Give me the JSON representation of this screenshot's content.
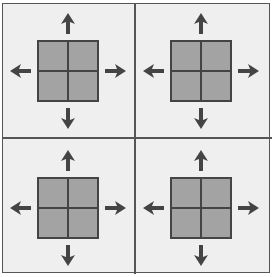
{
  "diagram": {
    "colors": {
      "background": "#efefef",
      "square_fill": "#a3a3a3",
      "lines": "#444444",
      "arrows": "#444444"
    },
    "panels": [
      {
        "id": "top-left",
        "cx": 68,
        "cy": 71,
        "arrows": [
          "up",
          "down",
          "left",
          "right"
        ]
      },
      {
        "id": "top-right",
        "cx": 201,
        "cy": 71,
        "arrows": [
          "up",
          "down",
          "left",
          "right"
        ]
      },
      {
        "id": "bottom-left",
        "cx": 68,
        "cy": 208,
        "arrows": [
          "up",
          "down",
          "left",
          "right"
        ]
      },
      {
        "id": "bottom-right",
        "cx": 201,
        "cy": 208,
        "arrows": [
          "up",
          "down",
          "left",
          "right"
        ]
      }
    ]
  }
}
